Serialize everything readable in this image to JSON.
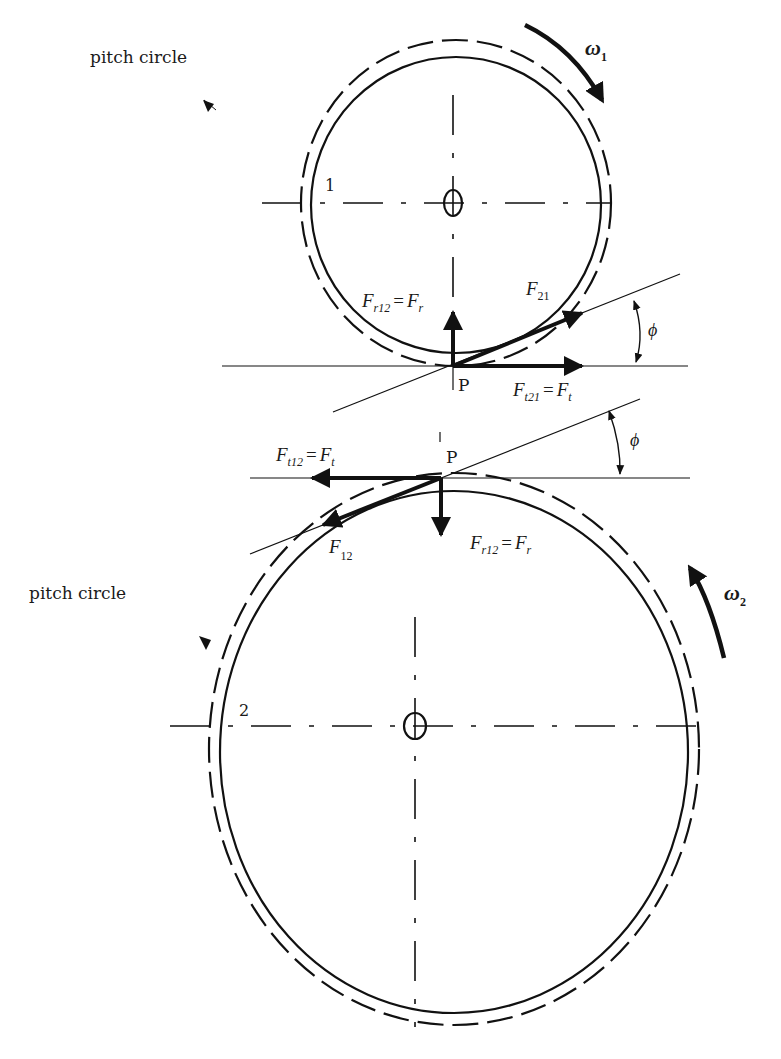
{
  "diagram": {
    "type": "gear-force-diagram",
    "gear1": {
      "label": "1",
      "pitch_circle_label": "pitch circle",
      "omega_symbol": "ω",
      "omega_subscript": "1",
      "forces": {
        "radial": {
          "lhs_main": "F",
          "lhs_sub": "r12",
          "eq": "=",
          "rhs_main": "F",
          "rhs_sub": "r"
        },
        "resultant": {
          "main": "F",
          "sub": "21"
        },
        "tangential": {
          "lhs_main": "F",
          "lhs_sub": "t21",
          "eq": "=",
          "rhs_main": "F",
          "rhs_sub": "t"
        }
      },
      "pitch_point": "P",
      "pressure_angle": "ϕ"
    },
    "gear2": {
      "label": "2",
      "pitch_circle_label": "pitch circle",
      "omega_symbol": "ω",
      "omega_subscript": "2",
      "forces": {
        "tangential": {
          "lhs_main": "F",
          "lhs_sub": "t12",
          "eq": "=",
          "rhs_main": "F",
          "rhs_sub": "t"
        },
        "resultant": {
          "main": "F",
          "sub": "12"
        },
        "radial": {
          "lhs_main": "F",
          "lhs_sub": "r12",
          "eq": "=",
          "rhs_main": "F",
          "rhs_sub": "r"
        }
      },
      "pitch_point": "P",
      "pressure_angle": "ϕ"
    }
  }
}
